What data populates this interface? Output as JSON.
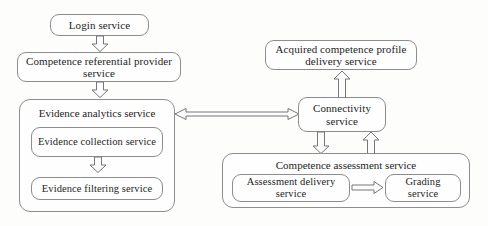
{
  "diagram": {
    "nodes": {
      "login_service": "Login service",
      "competence_referential_provider_service": "Competence referential provider service",
      "evidence_analytics_service": "Evidence analytics service",
      "evidence_collection_service": "Evidence collection service",
      "evidence_filtering_service": "Evidence filtering service",
      "acquired_competence_profile_delivery_service": "Acquired competence profile delivery service",
      "connectivity_service": "Connectivity service",
      "competence_assessment_service": "Competence assessment service",
      "assessment_delivery_service": "Assessment delivery service",
      "grading_service": "Grading service"
    },
    "colors": {
      "background": "#fdfdfc",
      "box_fill": "#fefefe",
      "box_border": "#8d8d8d",
      "arrow_stroke": "#77777a",
      "text": "#1d1d1d"
    },
    "edges": [
      {
        "id": "login-to-referential",
        "from": "login_service",
        "to": "competence_referential_provider_service",
        "direction": "down",
        "style": "hollow-block-arrow"
      },
      {
        "id": "referential-to-analytics",
        "from": "competence_referential_provider_service",
        "to": "evidence_analytics_service",
        "direction": "down",
        "style": "hollow-block-arrow"
      },
      {
        "id": "collection-to-filtering",
        "from": "evidence_collection_service",
        "to": "evidence_filtering_service",
        "direction": "down",
        "style": "hollow-block-arrow"
      },
      {
        "id": "analytics-connectivity",
        "from": "evidence_analytics_service",
        "to": "connectivity_service",
        "direction": "bidirectional",
        "style": "double-headed-line-arrow"
      },
      {
        "id": "connectivity-to-profile-delivery",
        "from": "connectivity_service",
        "to": "acquired_competence_profile_delivery_service",
        "direction": "up",
        "style": "hollow-block-arrow"
      },
      {
        "id": "connectivity-to-assessment",
        "from": "connectivity_service",
        "to": "competence_assessment_service",
        "direction": "down",
        "style": "hollow-block-arrow"
      },
      {
        "id": "assessment-to-connectivity",
        "from": "competence_assessment_service",
        "to": "connectivity_service",
        "direction": "up",
        "style": "hollow-block-arrow"
      },
      {
        "id": "delivery-to-grading",
        "from": "assessment_delivery_service",
        "to": "grading_service",
        "direction": "right",
        "style": "line-arrow"
      }
    ]
  }
}
